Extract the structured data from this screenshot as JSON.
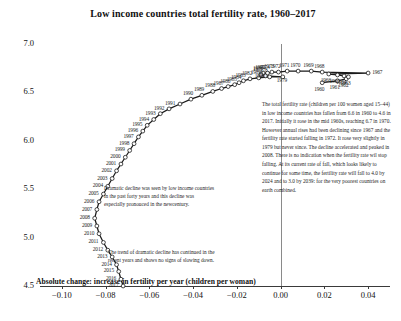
{
  "chart_data": {
    "type": "line",
    "title": "Low income countries total fertility rate, 1960–2017",
    "xlabel": "Absolute change: increase in fertility per year (children per woman)",
    "ylabel": "Total fertility rate in low income countries (children per woman)",
    "xlim": [
      -0.11,
      0.05
    ],
    "ylim": [
      4.5,
      7.0
    ],
    "grid": false,
    "legend": "none",
    "xticks": [
      "−0.10",
      "−0.08",
      "−0.06",
      "−0.04",
      "−0.02",
      "0.00",
      "0.02",
      "0.04"
    ],
    "xtick_values": [
      -0.1,
      -0.08,
      -0.06,
      -0.04,
      -0.02,
      0.0,
      0.02,
      0.04
    ],
    "yticks": [
      "7.0",
      "6.5",
      "6.0",
      "5.5",
      "5.0",
      "4.5"
    ],
    "ytick_values": [
      7.0,
      6.5,
      6.0,
      5.5,
      5.0,
      4.5
    ],
    "zero_reference_line": 0.0,
    "x_name": "absolute_change",
    "y_name": "fertility_rate",
    "point_label_key": "year",
    "points": [
      {
        "year": "1960",
        "x": 0.019,
        "y": 6.6
      },
      {
        "year": "1961",
        "x": 0.026,
        "y": 6.62
      },
      {
        "year": "1962",
        "x": 0.03,
        "y": 6.64
      },
      {
        "year": "1963",
        "x": 0.031,
        "y": 6.66
      },
      {
        "year": "1964",
        "x": 0.029,
        "y": 6.67
      },
      {
        "year": "1965",
        "x": 0.026,
        "y": 6.68
      },
      {
        "year": "1966",
        "x": 0.022,
        "y": 6.69
      },
      {
        "year": "1967",
        "x": 0.04,
        "y": 6.7
      },
      {
        "year": "1968",
        "x": 0.019,
        "y": 6.71
      },
      {
        "year": "1969",
        "x": 0.014,
        "y": 6.72
      },
      {
        "year": "1970",
        "x": 0.008,
        "y": 6.72
      },
      {
        "year": "1971",
        "x": 0.003,
        "y": 6.72
      },
      {
        "year": "1972",
        "x": -0.001,
        "y": 6.71
      },
      {
        "year": "1973",
        "x": -0.004,
        "y": 6.71
      },
      {
        "year": "1974",
        "x": -0.006,
        "y": 6.7
      },
      {
        "year": "1975",
        "x": -0.008,
        "y": 6.7
      },
      {
        "year": "1976",
        "x": -0.009,
        "y": 6.69
      },
      {
        "year": "1977",
        "x": -0.009,
        "y": 6.68
      },
      {
        "year": "1978",
        "x": -0.007,
        "y": 6.67
      },
      {
        "year": "1979",
        "x": 0.001,
        "y": 6.66
      },
      {
        "year": "1980",
        "x": -0.005,
        "y": 6.66
      },
      {
        "year": "1981",
        "x": -0.01,
        "y": 6.65
      },
      {
        "year": "1982",
        "x": -0.014,
        "y": 6.64
      },
      {
        "year": "1983",
        "x": -0.017,
        "y": 6.62
      },
      {
        "year": "1984",
        "x": -0.019,
        "y": 6.6
      },
      {
        "year": "1985",
        "x": -0.021,
        "y": 6.58
      },
      {
        "year": "1986",
        "x": -0.024,
        "y": 6.56
      },
      {
        "year": "1987",
        "x": -0.027,
        "y": 6.54
      },
      {
        "year": "1988",
        "x": -0.031,
        "y": 6.51
      },
      {
        "year": "1989",
        "x": -0.036,
        "y": 6.47
      },
      {
        "year": "1990",
        "x": -0.041,
        "y": 6.43
      },
      {
        "year": "1991",
        "x": -0.046,
        "y": 6.38
      },
      {
        "year": "1992",
        "x": -0.051,
        "y": 6.33
      },
      {
        "year": "1993",
        "x": -0.055,
        "y": 6.28
      },
      {
        "year": "1994",
        "x": -0.058,
        "y": 6.22
      },
      {
        "year": "1995",
        "x": -0.061,
        "y": 6.16
      },
      {
        "year": "1996",
        "x": -0.063,
        "y": 6.1
      },
      {
        "year": "1997",
        "x": -0.065,
        "y": 6.04
      },
      {
        "year": "1998",
        "x": -0.067,
        "y": 5.97
      },
      {
        "year": "1999",
        "x": -0.069,
        "y": 5.9
      },
      {
        "year": "2000",
        "x": -0.071,
        "y": 5.83
      },
      {
        "year": "2001",
        "x": -0.073,
        "y": 5.76
      },
      {
        "year": "2002",
        "x": -0.075,
        "y": 5.69
      },
      {
        "year": "2003",
        "x": -0.077,
        "y": 5.61
      },
      {
        "year": "2004",
        "x": -0.079,
        "y": 5.53
      },
      {
        "year": "2005",
        "x": -0.081,
        "y": 5.45
      },
      {
        "year": "2006",
        "x": -0.083,
        "y": 5.37
      },
      {
        "year": "2007",
        "x": -0.084,
        "y": 5.29
      },
      {
        "year": "2008",
        "x": -0.085,
        "y": 5.2
      },
      {
        "year": "2009",
        "x": -0.084,
        "y": 5.12
      },
      {
        "year": "2010",
        "x": -0.083,
        "y": 5.04
      },
      {
        "year": "2011",
        "x": -0.081,
        "y": 4.95
      },
      {
        "year": "2012",
        "x": -0.079,
        "y": 4.87
      },
      {
        "year": "2013",
        "x": -0.077,
        "y": 4.8
      },
      {
        "year": "2014",
        "x": -0.075,
        "y": 4.72
      },
      {
        "year": "2015",
        "x": -0.074,
        "y": 4.65
      },
      {
        "year": "2016",
        "x": -0.073,
        "y": 4.57
      },
      {
        "year": "2017",
        "x": -0.072,
        "y": 4.5
      }
    ]
  },
  "annotations": {
    "left_upper": "Dramatic decline was seen by low income countries in the past forty years and this decline was especially pronouced in the newcentury.",
    "left_lower": "The trend of dramatic decline has continued in the recent years and shows no signs of slowing down.",
    "side_box": "The total fertility rate (children per 100 women aged 15–44) in low income countries has fallen from 6.6 in 1960 to 4.6 in 2017. Initially it rose in the mid 1960s, reaching 6.7 in 1970. However annual rises had been declining since 1967 and the fertility rate started falling in 1972. It rose very slightly in 1979 but never since. The decline accelerated and peaked in 2008. There is no indication when the fertility rate wil stop falling. At its current rate of fall, which looks likely to continue for some time, the fertility rate will fall to 4.0 by 2024 and to 3.0 by 2039: for the very poorest countries on earth combined."
  }
}
